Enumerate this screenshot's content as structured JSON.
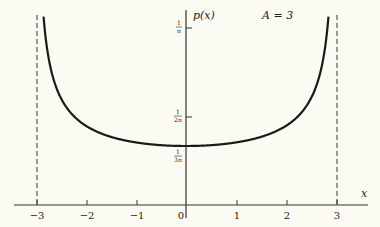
{
  "chart_data": {
    "type": "line",
    "title": "",
    "function": "p(x) = 1 / (pi * sqrt(A^2 - x^2))",
    "parameter": {
      "name": "A",
      "value": 3
    },
    "annotation": "A = 3",
    "xlabel": "x",
    "ylabel": "p(x)",
    "xlim": [
      -3.5,
      3.5
    ],
    "x_ticks": [
      -3,
      -2,
      -1,
      0,
      1,
      2,
      3
    ],
    "x_tick_labels": [
      "−3",
      "−2",
      "−1",
      "0",
      "1",
      "2",
      "3"
    ],
    "y_ticks": [
      0.1061,
      0.1592,
      0.3183
    ],
    "y_tick_labels": [
      {
        "num": "1",
        "den": "3π"
      },
      {
        "num": "1",
        "den": "2π"
      },
      {
        "num": "1",
        "den": "π"
      }
    ],
    "vertical_asymptotes": [
      -3,
      3
    ],
    "grid": false,
    "series": [
      {
        "name": "p(x)",
        "x": [
          -2.95,
          -2.9,
          -2.8,
          -2.5,
          -2.0,
          -1.5,
          -1.0,
          -0.5,
          0,
          0.5,
          1.0,
          1.5,
          2.0,
          2.5,
          2.8,
          2.9,
          2.95
        ],
        "values": [
          0.5823,
          0.4151,
          0.2955,
          0.192,
          0.1424,
          0.1225,
          0.1125,
          0.1076,
          0.1061,
          0.1076,
          0.1125,
          0.1225,
          0.1424,
          0.192,
          0.2955,
          0.4151,
          0.5823
        ]
      }
    ]
  },
  "labels": {
    "ylabel": "p(x)",
    "xlabel": "x",
    "param": "A = 3",
    "x_ticks": [
      "−3",
      "−2",
      "−1",
      "0",
      "1",
      "2",
      "3"
    ],
    "y1_num": "1",
    "y1_den": "π",
    "y2_num": "1",
    "y2_den": "2π",
    "y3_num": "1",
    "y3_den": "3π"
  }
}
